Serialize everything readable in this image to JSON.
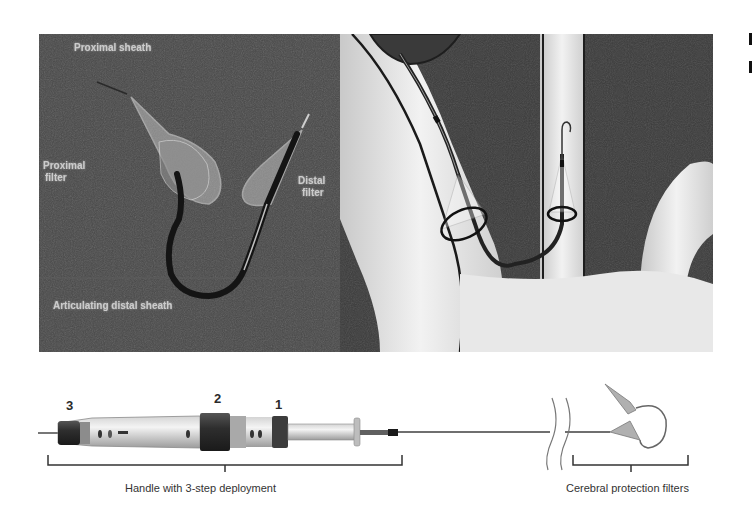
{
  "figure": {
    "top_left_photo": {
      "description": "Fluoroscopy-style photo of deployed dual-filter device",
      "labels": {
        "proximal_sheath": "Proximal sheath",
        "proximal_filter_line1": "Proximal",
        "proximal_filter_line2": "filter",
        "distal_filter_line1": "Distal",
        "distal_filter_line2": "filter",
        "articulating_sheath": "Articulating distal sheath"
      },
      "background_color": "#474747"
    },
    "top_right_illustration": {
      "description": "Illustration of filters deployed in aortic arch branch vessels",
      "background_color": "#3a3a3a",
      "vessel_color": "#e6e6e6"
    },
    "device": {
      "step_labels": [
        "3",
        "2",
        "1"
      ],
      "handle_caption": "Handle with 3-step deployment",
      "filters_caption": "Cerebral protection filters"
    }
  }
}
